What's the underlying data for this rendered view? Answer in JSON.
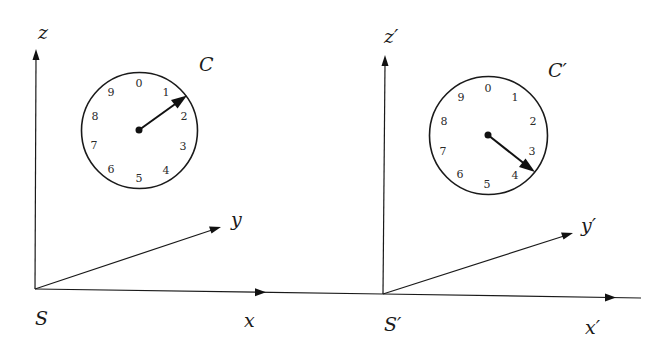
{
  "figure": {
    "frames": [
      {
        "id": "S",
        "origin_label": "S",
        "axes": {
          "x_label": "x",
          "y_label": "y",
          "z_label": "z"
        },
        "clock": {
          "label": "C",
          "dial_numbers": [
            "0",
            "1",
            "2",
            "3",
            "4",
            "5",
            "6",
            "7",
            "8",
            "9"
          ],
          "hand_points_to": "between 1 and 2"
        }
      },
      {
        "id": "S'",
        "origin_label": "S′",
        "axes": {
          "x_label": "x′",
          "y_label": "y′",
          "z_label": "z′"
        },
        "clock": {
          "label": "C′",
          "dial_numbers": [
            "0",
            "1",
            "2",
            "3",
            "4",
            "5",
            "6",
            "7",
            "8",
            "9"
          ],
          "hand_points_to": "between 3 and 4"
        }
      }
    ]
  },
  "colors": {
    "background": "#ffffff",
    "ink": "#1a1a1a"
  }
}
